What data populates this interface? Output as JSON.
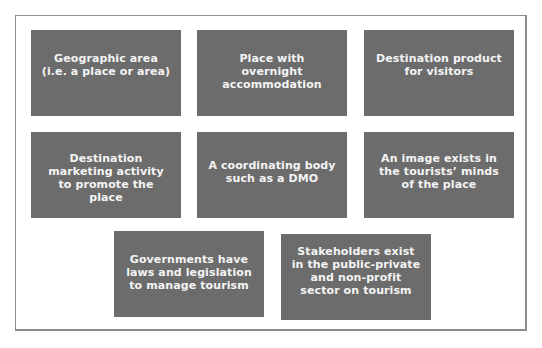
{
  "diagram": {
    "type": "grid-of-boxes",
    "box_color": "#6c6c6c",
    "text_color": "#f4f4f4",
    "frame_color": "#8c8c8c",
    "boxes": [
      {
        "label": "Geographic area (i.e. a place or area)"
      },
      {
        "label": "Place with overnight accommodation"
      },
      {
        "label": "Destination product for visitors"
      },
      {
        "label": "Destination marketing activity to promote the place"
      },
      {
        "label": "A coordinating body such as a DMO"
      },
      {
        "label": "An image exists in the tourists’ minds of the place"
      },
      {
        "label": "Governments have laws and legislation to manage tourism"
      },
      {
        "label": "Stakeholders exist in the public-private and non-profit sector on tourism"
      }
    ]
  }
}
